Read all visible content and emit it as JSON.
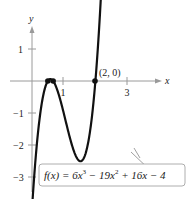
{
  "chart_data": {
    "type": "line",
    "title": "",
    "function_label": "f(x) = 6x³ − 19x² + 16x − 4",
    "function_label_parts": {
      "lhs": "f(x) = 6x",
      "e1": "3",
      "mid": " − 19x",
      "e2": "2",
      "rhs": " + 16x − 4"
    },
    "coefficients": [
      6,
      -19,
      16,
      -4
    ],
    "xlabel": "x",
    "ylabel": "y",
    "xlim": [
      -0.5,
      3.5
    ],
    "ylim": [
      -3.6,
      2.5
    ],
    "x_ticks": [
      {
        "value": 1,
        "label": "1"
      },
      {
        "value": 3,
        "label": "3"
      }
    ],
    "y_ticks": [
      {
        "value": 1,
        "label": "1"
      },
      {
        "value": -1,
        "label": "−1"
      },
      {
        "value": -2,
        "label": "−2"
      },
      {
        "value": -3,
        "label": "−3"
      }
    ],
    "annotations": [
      {
        "point": [
          2,
          0
        ],
        "label": "(2, 0)"
      }
    ],
    "zeros": [
      0.5,
      0.6667,
      2
    ],
    "x_domain_plotted": [
      0.02,
      2.3
    ],
    "grid": false,
    "legend": "none",
    "colors": {
      "curve": "#111111",
      "axis": "#888888",
      "text": "#222222"
    }
  },
  "axis": {
    "x_label": "x",
    "y_label": "y"
  },
  "ticks": {
    "x1": "1",
    "x3": "3",
    "y1": "1",
    "ym1": "−1",
    "ym2": "−2",
    "ym3": "−3"
  },
  "point_label": "(2, 0)"
}
